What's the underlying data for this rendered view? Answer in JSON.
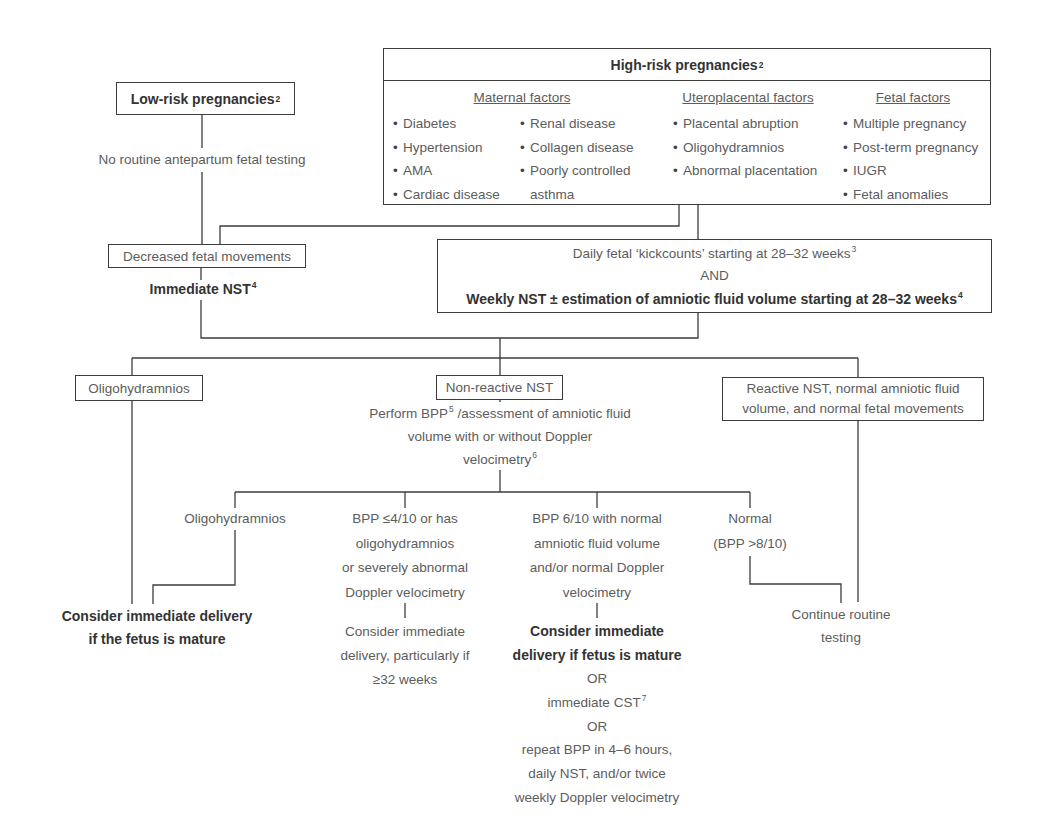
{
  "low_risk": {
    "title": "Low-risk pregnancies",
    "sup": "2",
    "note": "No routine antepartum fetal testing"
  },
  "high_risk": {
    "title": "High-risk pregnancies",
    "sup": "2",
    "maternal": {
      "header": "Maternal factors",
      "col1": [
        "Diabetes",
        "Hypertension",
        "AMA",
        "Cardiac disease"
      ],
      "col2": [
        "Renal disease",
        "Collagen disease",
        "Poorly controlled",
        "asthma"
      ]
    },
    "uteroplacental": {
      "header": "Uteroplacental factors",
      "items": [
        "Placental abruption",
        "Oligohydramnios",
        "Abnormal placentation"
      ]
    },
    "fetal": {
      "header": "Fetal factors",
      "items": [
        "Multiple pregnancy",
        "Post-term pregnancy",
        "IUGR",
        "Fetal anomalies"
      ]
    }
  },
  "decreased_movements": {
    "label": "Decreased fetal movements",
    "action": "Immediate NST",
    "action_sup": "4"
  },
  "surveillance": {
    "line1": "Daily fetal ‘kickcounts’ starting at 28–32 weeks",
    "line1_sup": "3",
    "connector": "AND",
    "line2": "Weekly NST ± estimation of amniotic fluid volume starting at 28–32 weeks",
    "line2_sup": "4"
  },
  "outcomes": {
    "oligohydramnios": "Oligohydramnios",
    "non_reactive": "Non-reactive NST",
    "reactive": [
      "Reactive NST, normal amniotic fluid",
      "volume, and normal fetal movements"
    ]
  },
  "bpp_step": {
    "line1_a": "Perform BPP",
    "line1_sup": "5",
    "line1_b": " /assessment of amniotic fluid",
    "line2": "volume with or without Doppler",
    "line3": "velocimetry",
    "line3_sup": "6"
  },
  "bpp_results": {
    "oligo": "Oligohydramnios",
    "low_score": [
      "BPP ≤4/10 or has",
      "oligohydramnios",
      "or severely abnormal",
      "Doppler velocimetry"
    ],
    "low_score_action": [
      "Consider immediate",
      "delivery, particularly if",
      "≥32 weeks"
    ],
    "mid_score": [
      "BPP 6/10 with normal",
      "amniotic fluid volume",
      "and/or normal Doppler",
      "velocimetry"
    ],
    "mid_score_action": {
      "bold": [
        "Consider immediate",
        "delivery if fetus is mature"
      ],
      "or1": "OR",
      "cst": "immediate CST",
      "cst_sup": "7",
      "or2": "OR",
      "repeat": [
        "repeat BPP in 4–6 hours,",
        "daily NST, and/or twice",
        "weekly Doppler velocimetry"
      ]
    },
    "normal": [
      "Normal",
      "(BPP >8/10)"
    ]
  },
  "final": {
    "deliver_if_mature": [
      "Consider immediate delivery",
      "if the fetus is mature"
    ],
    "continue": [
      "Continue routine",
      "testing"
    ]
  },
  "colors": {
    "line": "#3c3c3c",
    "text": "#5c5c5c",
    "bold_text": "#333333"
  }
}
